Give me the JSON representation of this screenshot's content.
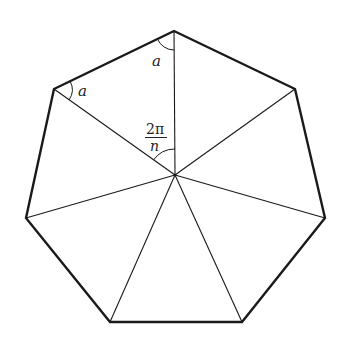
{
  "figure": {
    "sides": 7,
    "colors": {
      "stroke": "#1a1a1a",
      "background": "#ffffff"
    },
    "center": [
      175,
      175
    ],
    "vertices": [
      [
        174,
        31
      ],
      [
        295,
        89
      ],
      [
        325,
        218
      ],
      [
        242,
        322
      ],
      [
        110,
        322
      ],
      [
        26,
        218
      ],
      [
        54,
        89
      ]
    ],
    "labels": {
      "angle_top": "a",
      "angle_left": "a",
      "central_numerator": "2π",
      "central_denominator": "n"
    }
  }
}
